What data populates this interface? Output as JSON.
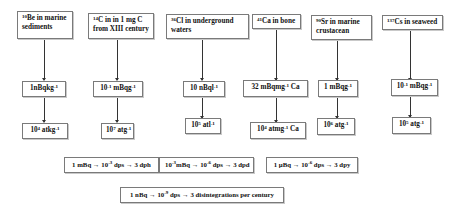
{
  "columns": [
    {
      "source": {
        "sup": "10",
        "text": "Be in marine sediments"
      },
      "activity": {
        "pre": "1nBqkg",
        "sup": "-1",
        "post": ""
      },
      "atoms": {
        "pre": "10",
        "sup": "4",
        "post": " atkg",
        "sup2": "-1",
        "post2": ""
      }
    },
    {
      "source": {
        "sup": "14",
        "text": "C in in 1 mg C from XIII century"
      },
      "activity": {
        "pre": "10",
        "sup": "-1",
        "post": " mBqg",
        "sup2": "-1"
      },
      "atoms": {
        "pre": "10",
        "sup": "7",
        "post": " atg",
        "sup2": "-1",
        "post2": ""
      }
    },
    {
      "source": {
        "sup": "36",
        "text": "Cl in underground waters"
      },
      "activity": {
        "pre": "10 nBql",
        "sup": "-1",
        "post": ""
      },
      "atoms": {
        "pre": "10",
        "sup": "5",
        "post": " atl",
        "sup2": "-1",
        "post2": ""
      }
    },
    {
      "source": {
        "sup": "41",
        "text": "Ca in bone"
      },
      "activity": {
        "pre": "32 mBqmg",
        "sup": "-1",
        "post": " Ca"
      },
      "atoms": {
        "pre": "10",
        "sup": "4",
        "post": " atmg",
        "sup2": "-1",
        "post2": " Ca"
      }
    },
    {
      "source": {
        "sup": "90",
        "text": "Sr in marine crustacean"
      },
      "activity": {
        "pre": "1 mBqg",
        "sup": "-1",
        "post": ""
      },
      "atoms": {
        "pre": "10",
        "sup": "6",
        "post": " atg",
        "sup2": "-1",
        "post2": ""
      }
    },
    {
      "source": {
        "sup": "137",
        "text": "Cs in seaweed"
      },
      "activity": {
        "pre": "10",
        "sup": "-1",
        "post": " mBqg",
        "sup2": "-1"
      },
      "atoms": {
        "pre": "10",
        "sup": "5",
        "post": " atg",
        "sup2": "-1",
        "post2": ""
      }
    }
  ],
  "legend": [
    {
      "p1": "1 mBq → 10",
      "s1": "-3",
      "p2": " dps → 3 dph"
    },
    {
      "p0": "10",
      "s0": "-3",
      "p1": "mBq → 10",
      "s1": "-6",
      "p2": " dps → 3 dpd"
    },
    {
      "p1": "1 µBq → 10",
      "s1": "-6",
      "p2": " dps → 3 dpy"
    },
    {
      "p1": "1 nBq → 10",
      "s1": "-9",
      "p2": " dps → 3 disintegrations per century"
    }
  ]
}
